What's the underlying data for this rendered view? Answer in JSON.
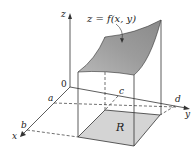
{
  "figure": {
    "type": "surface-over-rectangle",
    "surface_label": "z = f(x, y)",
    "region_label": "R",
    "origin_label": "0",
    "axes": {
      "x": "x",
      "y": "y",
      "z": "z"
    },
    "bounds": {
      "x_lower": "a",
      "x_upper": "b",
      "y_lower": "c",
      "y_upper": "d"
    },
    "colors": {
      "surface": "#a6a6a6",
      "region": "#d4d4d4",
      "lines": "#333333"
    }
  }
}
